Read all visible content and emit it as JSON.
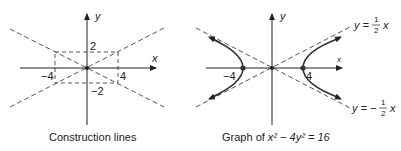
{
  "left_panel": {
    "caption": "Construction lines",
    "axis_x_label": "x",
    "axis_y_label": "y",
    "tick_labels": {
      "x_pos": "4",
      "x_neg": "−4",
      "y_pos": "2",
      "y_neg": "−2"
    }
  },
  "right_panel": {
    "caption_prefix": "Graph of ",
    "caption_equation": "x² − 4y² = 16",
    "axis_x_label": "x",
    "axis_y_label": "y",
    "vertex_labels": {
      "pos": "4",
      "neg": "−4"
    },
    "asymptote_pos": {
      "lhs": "y =",
      "num": "1",
      "den": "2",
      "var": "x"
    },
    "asymptote_neg": {
      "lhs": "y = −",
      "num": "1",
      "den": "2",
      "var": "x"
    }
  },
  "colors": {
    "ink": "#222222",
    "dash": "#444444",
    "curve": "#333333"
  }
}
